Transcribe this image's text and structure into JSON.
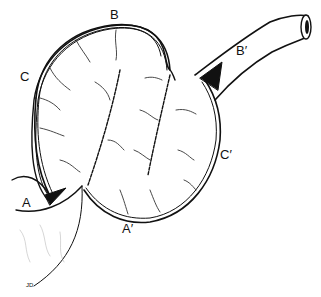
{
  "figure": {
    "type": "anatomical line drawing",
    "labels": [
      {
        "id": "A",
        "text": "A",
        "x": 22,
        "y": 200
      },
      {
        "id": "A-prime",
        "text": "A′",
        "x": 122,
        "y": 226
      },
      {
        "id": "B",
        "text": "B",
        "x": 110,
        "y": 10
      },
      {
        "id": "B-prime",
        "text": "B′",
        "x": 237,
        "y": 44
      },
      {
        "id": "C",
        "text": "C",
        "x": 20,
        "y": 71
      },
      {
        "id": "C-prime",
        "text": "C′",
        "x": 220,
        "y": 153
      }
    ],
    "signature": "JD"
  }
}
